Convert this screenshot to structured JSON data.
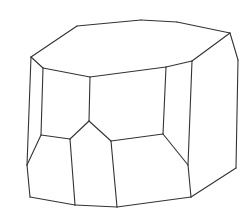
{
  "figure": {
    "type": "crystal-line-drawing",
    "stroke_color": "#333333",
    "background_color": "#ffffff",
    "vertices": {
      "T1": [
        31,
        57
      ],
      "T2": [
        77,
        26
      ],
      "T3": [
        141,
        20
      ],
      "T4": [
        177,
        22
      ],
      "T5": [
        230,
        33
      ],
      "T6": [
        192,
        61
      ],
      "T7": [
        166,
        67
      ],
      "T8": [
        90,
        77
      ],
      "T9": [
        43,
        68
      ],
      "R1": [
        238,
        60
      ],
      "R2": [
        236,
        168
      ],
      "R3": [
        191,
        197
      ],
      "M1": [
        188,
        165
      ],
      "M2": [
        163,
        134
      ],
      "M3": [
        111,
        141
      ],
      "M4": [
        89,
        121
      ],
      "M5": [
        70,
        139
      ],
      "M6": [
        41,
        135
      ],
      "L1": [
        27,
        165
      ],
      "B1": [
        30,
        197
      ],
      "B2": [
        75,
        205
      ],
      "B3": [
        117,
        207
      ]
    },
    "edges": [
      [
        "T1",
        "T2"
      ],
      [
        "T2",
        "T3"
      ],
      [
        "T3",
        "T4"
      ],
      [
        "T4",
        "T5"
      ],
      [
        "T5",
        "T6"
      ],
      [
        "T6",
        "T7"
      ],
      [
        "T7",
        "T8"
      ],
      [
        "T8",
        "T9"
      ],
      [
        "T9",
        "T1"
      ],
      [
        "T5",
        "R1"
      ],
      [
        "R1",
        "R2"
      ],
      [
        "R2",
        "R3"
      ],
      [
        "T6",
        "M1"
      ],
      [
        "M1",
        "R3"
      ],
      [
        "M1",
        "M2"
      ],
      [
        "T7",
        "M2"
      ],
      [
        "M2",
        "M3"
      ],
      [
        "T8",
        "M4"
      ],
      [
        "M4",
        "M3"
      ],
      [
        "M4",
        "M5"
      ],
      [
        "M5",
        "M6"
      ],
      [
        "T9",
        "M6"
      ],
      [
        "M6",
        "L1"
      ],
      [
        "T1",
        "L1"
      ],
      [
        "L1",
        "B1"
      ],
      [
        "B1",
        "B2"
      ],
      [
        "B2",
        "B3"
      ],
      [
        "B3",
        "R3"
      ],
      [
        "M5",
        "B2"
      ],
      [
        "M3",
        "B3"
      ]
    ]
  }
}
